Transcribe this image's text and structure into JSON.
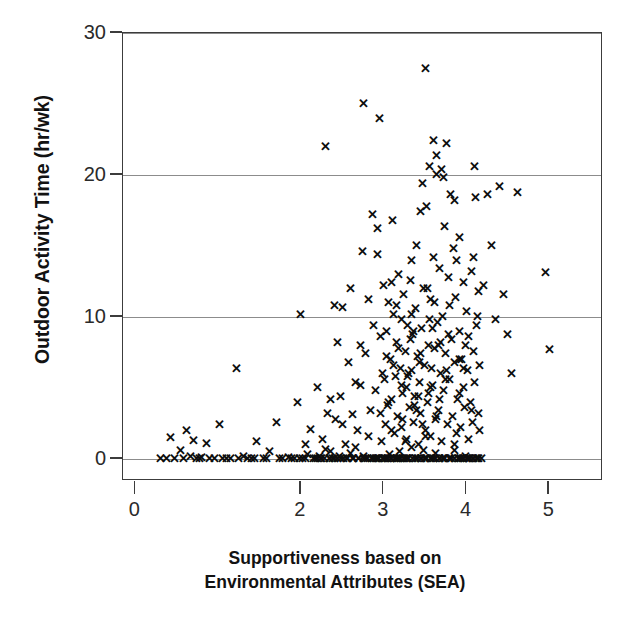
{
  "chart_data": {
    "type": "scatter",
    "title": "",
    "xlabel": "Supportiveness based on Environmental Attributes (SEA)",
    "xlabel_line1": "Supportiveness based on",
    "xlabel_line2": "Environmental Attributes (SEA)",
    "ylabel": "Outdoor Activity Time (hr/wk)",
    "xlim": [
      -0.15,
      5.65
    ],
    "ylim": [
      -1.55,
      30.0
    ],
    "xticks": [
      0,
      2,
      3,
      4,
      5
    ],
    "xtick_labels": [
      "0",
      "2",
      "3",
      "4",
      "5"
    ],
    "yticks": [
      0,
      10,
      20,
      30
    ],
    "ytick_labels": [
      "0",
      "10",
      "20",
      "30"
    ],
    "grid": "horizontal",
    "gridlines_at": [
      0,
      10,
      20,
      30
    ],
    "marker": "x",
    "marker_color": "#0d0d0d",
    "legend": null,
    "n_points": 331,
    "points": [
      [
        0.3,
        0.0
      ],
      [
        0.42,
        1.5
      ],
      [
        0.47,
        0.0
      ],
      [
        0.55,
        0.6
      ],
      [
        0.62,
        2.0
      ],
      [
        0.66,
        0.2
      ],
      [
        0.7,
        1.3
      ],
      [
        0.74,
        0.0
      ],
      [
        0.8,
        0.1
      ],
      [
        0.86,
        1.1
      ],
      [
        0.9,
        0.0
      ],
      [
        0.96,
        0.0
      ],
      [
        1.02,
        2.4
      ],
      [
        1.05,
        0.0
      ],
      [
        1.1,
        0.0
      ],
      [
        1.22,
        6.4
      ],
      [
        1.3,
        0.2
      ],
      [
        1.4,
        0.0
      ],
      [
        1.46,
        1.2
      ],
      [
        1.55,
        0.0
      ],
      [
        1.62,
        0.5
      ],
      [
        1.7,
        2.6
      ],
      [
        1.78,
        0.0
      ],
      [
        1.85,
        0.1
      ],
      [
        1.92,
        0.0
      ],
      [
        1.96,
        4.0
      ],
      [
        2.0,
        10.2
      ],
      [
        2.02,
        0.0
      ],
      [
        2.05,
        1.0
      ],
      [
        2.08,
        0.3
      ],
      [
        2.12,
        2.1
      ],
      [
        2.15,
        0.0
      ],
      [
        2.18,
        0.0
      ],
      [
        2.2,
        5.0
      ],
      [
        2.22,
        0.2
      ],
      [
        2.24,
        0.0
      ],
      [
        2.26,
        1.4
      ],
      [
        2.28,
        0.0
      ],
      [
        2.3,
        22.0
      ],
      [
        2.3,
        0.7
      ],
      [
        2.32,
        3.2
      ],
      [
        2.34,
        0.0
      ],
      [
        2.36,
        0.5
      ],
      [
        2.38,
        0.0
      ],
      [
        2.4,
        10.8
      ],
      [
        2.42,
        2.8
      ],
      [
        2.44,
        0.0
      ],
      [
        2.46,
        0.2
      ],
      [
        2.48,
        4.4
      ],
      [
        2.5,
        10.7
      ],
      [
        2.52,
        0.0
      ],
      [
        2.54,
        1.0
      ],
      [
        2.56,
        0.0
      ],
      [
        2.58,
        6.8
      ],
      [
        2.6,
        0.4
      ],
      [
        2.62,
        3.1
      ],
      [
        2.64,
        0.0
      ],
      [
        2.66,
        0.8
      ],
      [
        2.68,
        2.0
      ],
      [
        2.7,
        0.0
      ],
      [
        2.72,
        5.2
      ],
      [
        2.74,
        14.6
      ],
      [
        2.75,
        25.0
      ],
      [
        2.76,
        0.2
      ],
      [
        2.78,
        7.4
      ],
      [
        2.8,
        0.0
      ],
      [
        2.82,
        1.6
      ],
      [
        2.84,
        3.4
      ],
      [
        2.86,
        17.2
      ],
      [
        2.88,
        0.0
      ],
      [
        2.9,
        4.8
      ],
      [
        2.92,
        16.2
      ],
      [
        2.93,
        14.4
      ],
      [
        2.94,
        0.0
      ],
      [
        2.95,
        24.0
      ],
      [
        2.96,
        8.6
      ],
      [
        2.97,
        1.2
      ],
      [
        2.98,
        6.0
      ],
      [
        2.99,
        0.0
      ],
      [
        3.0,
        12.2
      ],
      [
        3.0,
        0.0
      ],
      [
        3.01,
        5.6
      ],
      [
        3.02,
        2.4
      ],
      [
        3.03,
        9.0
      ],
      [
        3.04,
        0.0
      ],
      [
        3.05,
        3.8
      ],
      [
        3.06,
        11.0
      ],
      [
        3.07,
        0.3
      ],
      [
        3.08,
        7.0
      ],
      [
        3.09,
        4.2
      ],
      [
        3.1,
        0.0
      ],
      [
        3.11,
        16.8
      ],
      [
        3.12,
        10.2
      ],
      [
        3.13,
        1.8
      ],
      [
        3.14,
        5.8
      ],
      [
        3.15,
        0.0
      ],
      [
        3.16,
        8.2
      ],
      [
        3.17,
        3.0
      ],
      [
        3.18,
        13.0
      ],
      [
        3.19,
        0.5
      ],
      [
        3.2,
        6.4
      ],
      [
        3.2,
        0.0
      ],
      [
        3.21,
        9.8
      ],
      [
        3.22,
        2.2
      ],
      [
        3.23,
        4.6
      ],
      [
        3.24,
        11.6
      ],
      [
        3.25,
        0.0
      ],
      [
        3.26,
        7.6
      ],
      [
        3.27,
        1.4
      ],
      [
        3.28,
        5.0
      ],
      [
        3.29,
        9.4
      ],
      [
        3.3,
        0.0
      ],
      [
        3.31,
        3.6
      ],
      [
        3.32,
        12.6
      ],
      [
        3.33,
        6.2
      ],
      [
        3.34,
        0.8
      ],
      [
        3.35,
        8.8
      ],
      [
        3.36,
        2.6
      ],
      [
        3.37,
        4.4
      ],
      [
        3.38,
        10.6
      ],
      [
        3.39,
        0.0
      ],
      [
        3.4,
        15.0
      ],
      [
        3.41,
        7.2
      ],
      [
        3.42,
        1.0
      ],
      [
        3.43,
        5.4
      ],
      [
        3.44,
        3.2
      ],
      [
        3.45,
        0.0
      ],
      [
        3.46,
        9.2
      ],
      [
        3.47,
        19.4
      ],
      [
        3.48,
        12.0
      ],
      [
        3.49,
        6.6
      ],
      [
        3.5,
        27.5
      ],
      [
        3.5,
        0.0
      ],
      [
        3.51,
        2.0
      ],
      [
        3.52,
        17.8
      ],
      [
        3.53,
        4.0
      ],
      [
        3.54,
        8.0
      ],
      [
        3.55,
        20.6
      ],
      [
        3.56,
        1.6
      ],
      [
        3.57,
        11.2
      ],
      [
        3.58,
        0.0
      ],
      [
        3.59,
        5.2
      ],
      [
        3.6,
        22.4
      ],
      [
        3.6,
        14.2
      ],
      [
        3.61,
        7.8
      ],
      [
        3.62,
        2.8
      ],
      [
        3.63,
        0.4
      ],
      [
        3.64,
        20.0
      ],
      [
        3.65,
        9.6
      ],
      [
        3.66,
        3.4
      ],
      [
        3.67,
        13.4
      ],
      [
        3.68,
        0.0
      ],
      [
        3.69,
        6.0
      ],
      [
        3.7,
        20.4
      ],
      [
        3.7,
        1.2
      ],
      [
        3.71,
        10.0
      ],
      [
        3.72,
        4.8
      ],
      [
        3.73,
        16.4
      ],
      [
        3.74,
        0.0
      ],
      [
        3.75,
        7.4
      ],
      [
        3.76,
        22.2
      ],
      [
        3.77,
        2.4
      ],
      [
        3.78,
        12.8
      ],
      [
        3.79,
        5.6
      ],
      [
        3.8,
        0.0
      ],
      [
        3.81,
        18.6
      ],
      [
        3.82,
        8.4
      ],
      [
        3.83,
        3.0
      ],
      [
        3.84,
        14.8
      ],
      [
        3.85,
        0.6
      ],
      [
        3.86,
        6.8
      ],
      [
        3.87,
        11.4
      ],
      [
        3.88,
        1.8
      ],
      [
        3.89,
        4.2
      ],
      [
        3.9,
        0.0
      ],
      [
        3.91,
        9.0
      ],
      [
        3.92,
        15.6
      ],
      [
        3.93,
        2.2
      ],
      [
        3.94,
        7.0
      ],
      [
        3.95,
        0.0
      ],
      [
        3.96,
        12.4
      ],
      [
        3.97,
        5.0
      ],
      [
        3.98,
        3.6
      ],
      [
        3.99,
        0.2
      ],
      [
        4.0,
        10.4
      ],
      [
        4.0,
        0.0
      ],
      [
        4.01,
        6.2
      ],
      [
        4.02,
        1.4
      ],
      [
        4.03,
        8.6
      ],
      [
        4.04,
        0.0
      ],
      [
        4.05,
        4.0
      ],
      [
        4.06,
        13.2
      ],
      [
        4.07,
        2.6
      ],
      [
        4.08,
        7.6
      ],
      [
        4.09,
        0.0
      ],
      [
        4.1,
        20.6
      ],
      [
        4.1,
        5.4
      ],
      [
        4.11,
        18.4
      ],
      [
        4.12,
        9.4
      ],
      [
        4.13,
        0.0
      ],
      [
        4.14,
        3.2
      ],
      [
        4.15,
        11.8
      ],
      [
        4.16,
        6.6
      ],
      [
        4.18,
        0.0
      ],
      [
        4.2,
        12.2
      ],
      [
        4.25,
        18.6
      ],
      [
        4.3,
        15.0
      ],
      [
        4.35,
        9.8
      ],
      [
        4.4,
        19.2
      ],
      [
        4.45,
        11.6
      ],
      [
        4.5,
        8.8
      ],
      [
        4.55,
        6.0
      ],
      [
        4.62,
        18.8
      ],
      [
        4.95,
        13.1
      ],
      [
        5.0,
        7.7
      ],
      [
        2.85,
        0.0
      ],
      [
        2.91,
        0.0
      ],
      [
        3.02,
        0.0
      ],
      [
        3.08,
        0.0
      ],
      [
        3.13,
        0.0
      ],
      [
        3.18,
        0.0
      ],
      [
        3.24,
        0.0
      ],
      [
        3.29,
        0.0
      ],
      [
        3.35,
        0.0
      ],
      [
        3.41,
        0.0
      ],
      [
        3.46,
        0.0
      ],
      [
        3.52,
        0.0
      ],
      [
        3.57,
        0.0
      ],
      [
        3.63,
        0.0
      ],
      [
        3.68,
        0.0
      ],
      [
        3.74,
        0.0
      ],
      [
        3.79,
        0.0
      ],
      [
        3.85,
        0.0
      ],
      [
        3.9,
        0.0
      ],
      [
        3.96,
        0.0
      ],
      [
        4.02,
        0.0
      ],
      [
        4.07,
        0.0
      ],
      [
        4.12,
        0.0
      ],
      [
        2.4,
        0.0
      ],
      [
        2.55,
        0.0
      ],
      [
        2.7,
        0.0
      ],
      [
        2.78,
        0.0
      ],
      [
        2.94,
        0.0
      ],
      [
        3.05,
        0.0
      ],
      [
        3.16,
        0.0
      ],
      [
        3.27,
        0.0
      ],
      [
        3.38,
        0.0
      ],
      [
        3.49,
        0.0
      ],
      [
        3.6,
        0.0
      ],
      [
        3.71,
        0.0
      ],
      [
        3.82,
        0.0
      ],
      [
        3.93,
        0.0
      ],
      [
        4.04,
        0.0
      ],
      [
        4.15,
        0.0
      ],
      [
        2.05,
        0.0
      ],
      [
        2.25,
        0.0
      ],
      [
        3.03,
        7.2
      ],
      [
        3.09,
        2.0
      ],
      [
        3.15,
        10.8
      ],
      [
        3.21,
        5.2
      ],
      [
        3.26,
        1.2
      ],
      [
        3.32,
        8.4
      ],
      [
        3.37,
        3.8
      ],
      [
        3.43,
        6.8
      ],
      [
        3.48,
        0.6
      ],
      [
        3.54,
        4.6
      ],
      [
        3.59,
        9.2
      ],
      [
        3.12,
        6.6
      ],
      [
        3.06,
        4.0
      ],
      [
        3.18,
        7.8
      ],
      [
        3.23,
        2.8
      ],
      [
        3.29,
        5.8
      ],
      [
        3.34,
        10.2
      ],
      [
        3.4,
        3.4
      ],
      [
        3.45,
        7.4
      ],
      [
        3.51,
        1.6
      ],
      [
        3.56,
        5.0
      ],
      [
        3.61,
        11.0
      ],
      [
        3.66,
        8.0
      ],
      [
        3.3,
        6.0
      ],
      [
        3.36,
        9.0
      ],
      [
        3.42,
        4.4
      ],
      [
        3.47,
        2.4
      ],
      [
        3.53,
        12.0
      ],
      [
        3.58,
        6.4
      ],
      [
        3.64,
        3.0
      ],
      [
        3.69,
        8.2
      ],
      [
        3.75,
        5.6
      ],
      [
        3.8,
        10.8
      ],
      [
        3.86,
        1.0
      ],
      [
        3.91,
        7.0
      ],
      [
        2.88,
        9.4
      ],
      [
        2.96,
        3.2
      ],
      [
        3.1,
        12.4
      ],
      [
        3.33,
        14.0
      ],
      [
        3.44,
        17.4
      ],
      [
        3.55,
        9.8
      ],
      [
        3.67,
        4.2
      ],
      [
        3.78,
        8.8
      ],
      [
        3.88,
        14.0
      ],
      [
        4.06,
        3.4
      ],
      [
        2.6,
        12.0
      ],
      [
        2.72,
        8.0
      ],
      [
        2.82,
        11.2
      ],
      [
        2.66,
        5.4
      ],
      [
        2.5,
        2.4
      ],
      [
        2.44,
        8.2
      ],
      [
        2.36,
        4.2
      ],
      [
        2.2,
        0.0
      ],
      [
        2.34,
        0.0
      ],
      [
        2.48,
        0.0
      ],
      [
        2.62,
        0.0
      ],
      [
        2.76,
        0.0
      ],
      [
        2.9,
        0.0
      ],
      [
        1.98,
        0.0
      ],
      [
        1.88,
        0.0
      ],
      [
        1.74,
        0.0
      ],
      [
        1.58,
        0.0
      ],
      [
        1.44,
        0.0
      ],
      [
        1.35,
        0.0
      ],
      [
        1.25,
        0.0
      ],
      [
        1.15,
        0.0
      ],
      [
        0.78,
        0.0
      ],
      [
        0.58,
        0.0
      ],
      [
        0.38,
        0.0
      ],
      [
        3.96,
        6.4
      ],
      [
        4.08,
        14.2
      ],
      [
        3.72,
        19.8
      ],
      [
        3.86,
        18.2
      ],
      [
        3.64,
        21.4
      ],
      [
        4.13,
        10.0
      ],
      [
        4.16,
        2.0
      ],
      [
        3.99,
        8.0
      ],
      [
        3.92,
        4.6
      ],
      [
        3.76,
        6.2
      ]
    ]
  },
  "axis": {
    "y_title": "Outdoor Activity Time (hr/wk)",
    "x_title_line1": "Supportiveness based on",
    "x_title_line2": "Environmental Attributes (SEA)"
  }
}
